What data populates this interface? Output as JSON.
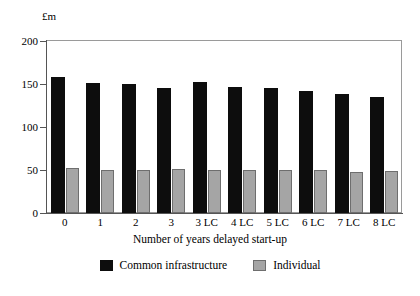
{
  "chart_data": {
    "type": "bar",
    "title": "",
    "xlabel": "Number of years delayed start-up",
    "ylabel": "£m",
    "ylim": [
      0,
      200
    ],
    "yticks": [
      0,
      50,
      100,
      150,
      200
    ],
    "ytick_labels": [
      "0",
      "50",
      "100",
      "150",
      "200"
    ],
    "grid": false,
    "legend_position": "bottom-center",
    "categories": [
      "0",
      "1",
      "2",
      "3",
      "3 LC",
      "4 LC",
      "5 LC",
      "6 LC",
      "7 LC",
      "8 LC"
    ],
    "series": [
      {
        "name": "Common infrastructure",
        "color": "#0d0d0d",
        "values": [
          158,
          151,
          150,
          145,
          152,
          147,
          145,
          142,
          138,
          135
        ]
      },
      {
        "name": "Individual",
        "color": "#a5a5a5",
        "values": [
          52,
          50,
          50,
          51,
          50,
          50,
          50,
          50,
          48,
          49
        ]
      }
    ]
  },
  "legend": {
    "entries": [
      {
        "label": "Common infrastructure"
      },
      {
        "label": "Individual"
      }
    ]
  },
  "colors": {
    "common_infrastructure": "#0d0d0d",
    "individual": "#a5a5a5",
    "individual_border": "#6e6e6e",
    "axis": "#555555",
    "frame": "#9a9a9a",
    "background": "#ffffff"
  }
}
